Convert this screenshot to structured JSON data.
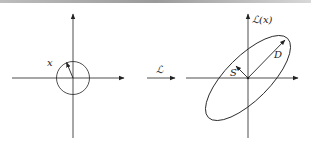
{
  "figure": {
    "left_panel": {
      "vector_label": "x",
      "shape": "circle"
    },
    "transform": {
      "label": "ℒ"
    },
    "right_panel": {
      "axis_label": "ℒ(x)",
      "major_label": "D",
      "minor_label": "S",
      "shape": "ellipse"
    },
    "colors": {
      "stroke": "#222222",
      "background": "#ffffff"
    }
  }
}
